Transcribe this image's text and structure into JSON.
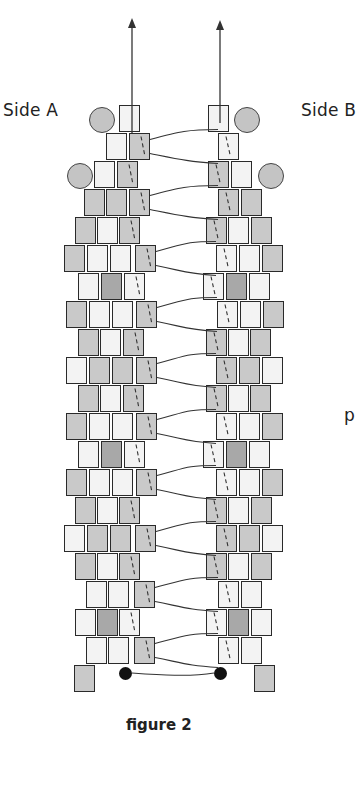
{
  "labels": {
    "side_a": "Side A",
    "side_b": "Side B",
    "side_text_fragment": "p",
    "caption": "figure 2"
  },
  "colors": {
    "L": "#f3f3f3",
    "M": "#c9c9c9",
    "D": "#a8a8a8",
    "circle": "#c4c4c4",
    "thread": "#333333"
  },
  "bead": {
    "w": 21,
    "h": 27,
    "row_pitch": 28,
    "top": 105
  },
  "rows": [
    {
      "a": [
        [
          119,
          "L"
        ]
      ],
      "b": [
        [
          208,
          "L"
        ]
      ]
    },
    {
      "a": [
        [
          106,
          "L"
        ],
        [
          129,
          "M"
        ]
      ],
      "b": [
        [
          218,
          "L"
        ]
      ]
    },
    {
      "a": [
        [
          94,
          "L"
        ],
        [
          117,
          "M"
        ]
      ],
      "b": [
        [
          208,
          "M"
        ],
        [
          231,
          "L"
        ]
      ]
    },
    {
      "a": [
        [
          84,
          "M"
        ],
        [
          106,
          "M"
        ],
        [
          129,
          "M"
        ]
      ],
      "b": [
        [
          218,
          "M"
        ],
        [
          241,
          "M"
        ]
      ]
    },
    {
      "a": [
        [
          75,
          "M"
        ],
        [
          97,
          "L"
        ],
        [
          119,
          "M"
        ]
      ],
      "b": [
        [
          206,
          "M"
        ],
        [
          228,
          "L"
        ],
        [
          251,
          "M"
        ]
      ]
    },
    {
      "a": [
        [
          64,
          "M"
        ],
        [
          87,
          "L"
        ],
        [
          110,
          "L"
        ],
        [
          135,
          "M"
        ]
      ],
      "b": [
        [
          216,
          "L"
        ],
        [
          239,
          "L"
        ],
        [
          262,
          "M"
        ]
      ]
    },
    {
      "a": [
        [
          78,
          "L"
        ],
        [
          101,
          "D"
        ],
        [
          124,
          "L"
        ]
      ],
      "b": [
        [
          203,
          "L"
        ],
        [
          226,
          "D"
        ],
        [
          249,
          "L"
        ]
      ]
    },
    {
      "a": [
        [
          66,
          "M"
        ],
        [
          89,
          "L"
        ],
        [
          112,
          "L"
        ],
        [
          136,
          "M"
        ]
      ],
      "b": [
        [
          217,
          "L"
        ],
        [
          240,
          "L"
        ],
        [
          263,
          "M"
        ]
      ]
    },
    {
      "a": [
        [
          78,
          "M"
        ],
        [
          100,
          "L"
        ],
        [
          123,
          "M"
        ]
      ],
      "b": [
        [
          206,
          "M"
        ],
        [
          228,
          "L"
        ],
        [
          250,
          "M"
        ]
      ]
    },
    {
      "a": [
        [
          66,
          "L"
        ],
        [
          89,
          "M"
        ],
        [
          112,
          "M"
        ],
        [
          136,
          "M"
        ]
      ],
      "b": [
        [
          216,
          "M"
        ],
        [
          239,
          "M"
        ],
        [
          262,
          "L"
        ]
      ]
    },
    {
      "a": [
        [
          78,
          "M"
        ],
        [
          100,
          "L"
        ],
        [
          123,
          "M"
        ]
      ],
      "b": [
        [
          206,
          "M"
        ],
        [
          228,
          "L"
        ],
        [
          250,
          "M"
        ]
      ]
    },
    {
      "a": [
        [
          66,
          "M"
        ],
        [
          89,
          "L"
        ],
        [
          112,
          "L"
        ],
        [
          136,
          "M"
        ]
      ],
      "b": [
        [
          216,
          "L"
        ],
        [
          239,
          "L"
        ],
        [
          262,
          "M"
        ]
      ]
    },
    {
      "a": [
        [
          78,
          "L"
        ],
        [
          101,
          "D"
        ],
        [
          124,
          "L"
        ]
      ],
      "b": [
        [
          203,
          "L"
        ],
        [
          226,
          "D"
        ],
        [
          249,
          "L"
        ]
      ]
    },
    {
      "a": [
        [
          66,
          "M"
        ],
        [
          89,
          "L"
        ],
        [
          112,
          "L"
        ],
        [
          136,
          "M"
        ]
      ],
      "b": [
        [
          216,
          "L"
        ],
        [
          239,
          "L"
        ],
        [
          262,
          "M"
        ]
      ]
    },
    {
      "a": [
        [
          75,
          "M"
        ],
        [
          97,
          "L"
        ],
        [
          119,
          "M"
        ]
      ],
      "b": [
        [
          206,
          "M"
        ],
        [
          228,
          "L"
        ],
        [
          251,
          "M"
        ]
      ]
    },
    {
      "a": [
        [
          64,
          "L"
        ],
        [
          87,
          "M"
        ],
        [
          110,
          "M"
        ],
        [
          135,
          "M"
        ]
      ],
      "b": [
        [
          216,
          "M"
        ],
        [
          239,
          "M"
        ],
        [
          262,
          "L"
        ]
      ]
    },
    {
      "a": [
        [
          75,
          "M"
        ],
        [
          97,
          "L"
        ],
        [
          119,
          "M"
        ]
      ],
      "b": [
        [
          206,
          "M"
        ],
        [
          228,
          "L"
        ],
        [
          251,
          "M"
        ]
      ]
    },
    {
      "a": [
        [
          86,
          "L"
        ],
        [
          108,
          "L"
        ],
        [
          134,
          "M"
        ]
      ],
      "b": [
        [
          218,
          "L"
        ],
        [
          241,
          "L"
        ]
      ]
    },
    {
      "a": [
        [
          75,
          "L"
        ],
        [
          97,
          "D"
        ],
        [
          119,
          "L"
        ]
      ],
      "b": [
        [
          206,
          "L"
        ],
        [
          228,
          "D"
        ],
        [
          251,
          "L"
        ]
      ]
    },
    {
      "a": [
        [
          86,
          "L"
        ],
        [
          108,
          "L"
        ],
        [
          134,
          "M"
        ]
      ],
      "b": [
        [
          218,
          "L"
        ],
        [
          241,
          "L"
        ]
      ]
    },
    {
      "a": [
        [
          74,
          "M"
        ]
      ],
      "b": [
        [
          254,
          "M"
        ]
      ]
    }
  ],
  "circles": [
    {
      "x": 89,
      "y": 107,
      "d": 26
    },
    {
      "x": 234,
      "y": 107,
      "d": 26
    },
    {
      "x": 67,
      "y": 163,
      "d": 26
    },
    {
      "x": 258,
      "y": 163,
      "d": 26
    }
  ],
  "end_dots": [
    {
      "x": 119,
      "y": 667
    },
    {
      "x": 214,
      "y": 667
    }
  ],
  "arrows": [
    {
      "x": 132,
      "y_top": 18,
      "y_bottom": 133
    },
    {
      "x": 220,
      "y_top": 20,
      "y_bottom": 123
    }
  ]
}
